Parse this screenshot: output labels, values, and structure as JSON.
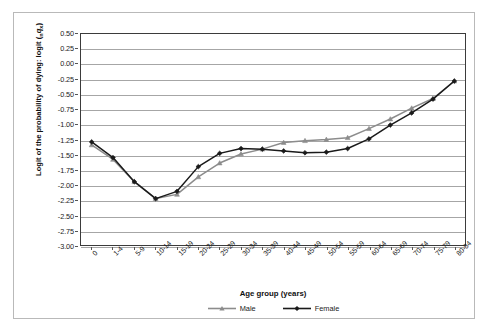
{
  "chart_data": {
    "type": "line",
    "title": "",
    "xlabel": "Age group (years)",
    "ylabel_plain": "Logit of the probability of dying: logit (nqx)",
    "ylabel_main": "Logit of the probability of dying: logit (",
    "ylabel_sub": "n",
    "ylabel_var": "q",
    "ylabel_var_sub": "x",
    "ylabel_close": ")",
    "categories": [
      "0",
      "1-4",
      "5-9",
      "10-14",
      "15-19",
      "20-24",
      "25-29",
      "30-34",
      "35-39",
      "40-44",
      "45-49",
      "50-54",
      "55-59",
      "60-64",
      "65-69",
      "70-74",
      "75-79",
      "80-84"
    ],
    "ylim": [
      -3.0,
      0.5
    ],
    "ytick_values": [
      0.5,
      0.25,
      0.0,
      -0.25,
      -0.5,
      -0.75,
      -1.0,
      -1.25,
      -1.5,
      -1.75,
      -2.0,
      -2.25,
      -2.5,
      -2.75,
      -3.0
    ],
    "ytick_labels": [
      "0.50",
      "0.25",
      "0.00",
      "-0.25",
      "-0.50",
      "-0.75",
      "-1.00",
      "-1.25",
      "-1.50",
      "-1.75",
      "-2.00",
      "-2.25",
      "-2.50",
      "-2.75",
      "-3.00"
    ],
    "grid": true,
    "legend_position": "bottom",
    "series": [
      {
        "name": "Male",
        "color": "#8c8c8c",
        "marker": "triangle",
        "values": [
          -1.34,
          -1.58,
          -1.95,
          -2.23,
          -2.16,
          -1.87,
          -1.64,
          -1.49,
          -1.41,
          -1.3,
          -1.27,
          -1.25,
          -1.22,
          -1.07,
          -0.91,
          -0.73,
          -0.57,
          -0.28
        ]
      },
      {
        "name": "Female",
        "color": "#1a1a1a",
        "marker": "diamond",
        "values": [
          -1.29,
          -1.55,
          -1.95,
          -2.23,
          -2.11,
          -1.7,
          -1.48,
          -1.4,
          -1.41,
          -1.44,
          -1.47,
          -1.46,
          -1.4,
          -1.24,
          -1.01,
          -0.81,
          -0.58,
          -0.28
        ]
      }
    ]
  },
  "legend": {
    "items": [
      {
        "label": "Male"
      },
      {
        "label": "Female"
      }
    ]
  }
}
